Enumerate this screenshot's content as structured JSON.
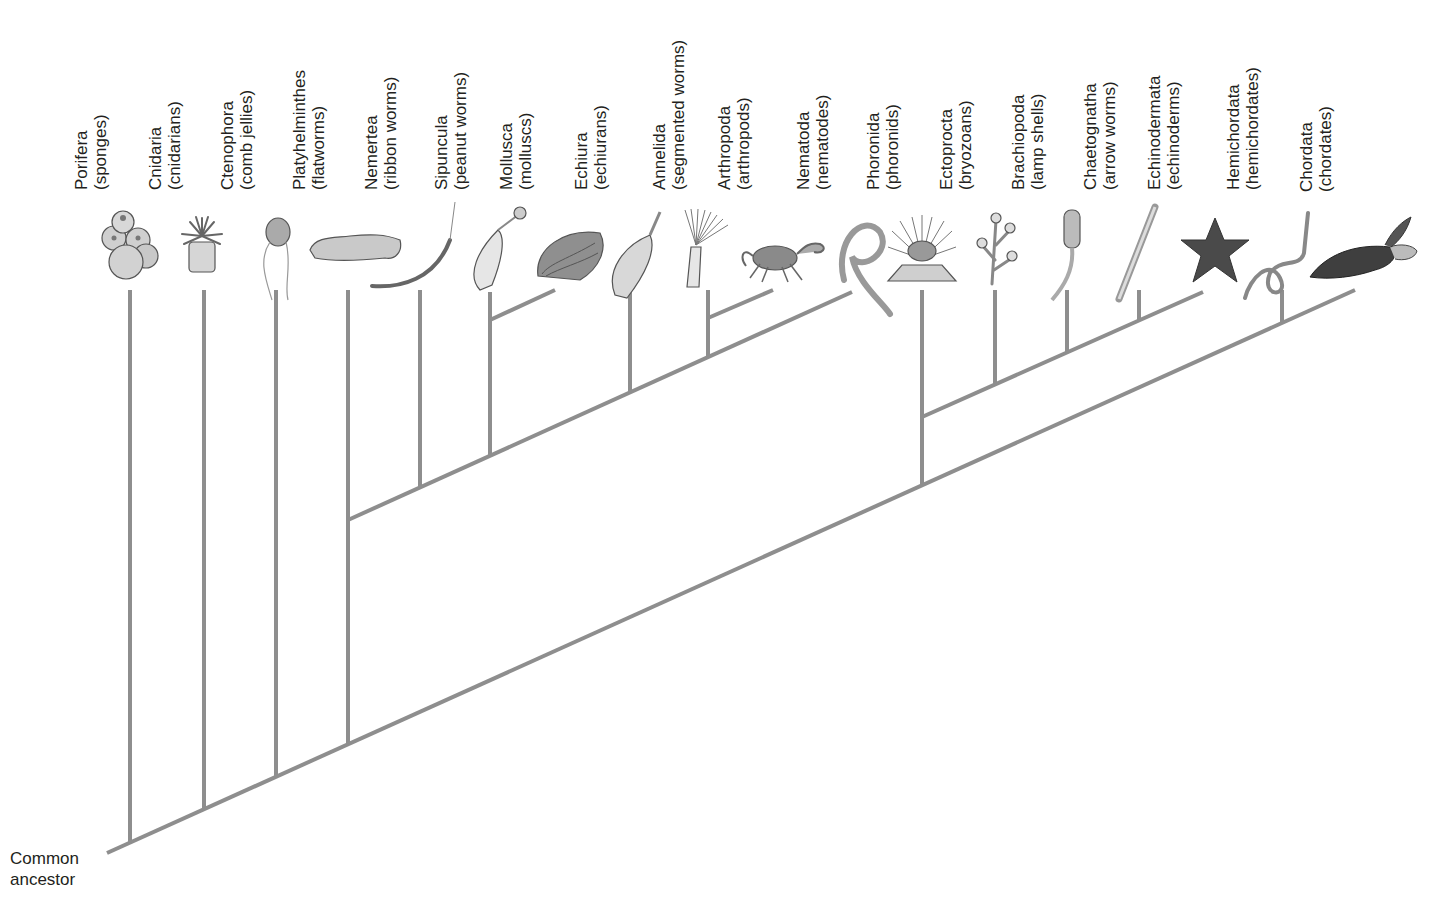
{
  "diagram": {
    "root_label": "Common ancestor",
    "line_color": "#8e8e8e",
    "taxa": [
      {
        "name": "Porifera",
        "common": "(sponges)",
        "icon": "sponge-icon",
        "x": 130
      },
      {
        "name": "Cnidaria",
        "common": "(cnidarians)",
        "icon": "sea-anemone-icon",
        "x": 204
      },
      {
        "name": "Ctenophora",
        "common": "(comb jellies)",
        "icon": "comb-jelly-icon",
        "x": 276
      },
      {
        "name": "Platyhelminthes",
        "common": "(flatworms)",
        "icon": "flatworm-icon",
        "x": 348
      },
      {
        "name": "Nemertea",
        "common": "(ribbon worms)",
        "icon": "ribbon-worm-icon",
        "x": 420
      },
      {
        "name": "Sipuncula",
        "common": "(peanut worms)",
        "icon": "peanut-worm-icon",
        "x": 490
      },
      {
        "name": "Mollusca",
        "common": "(molluscs)",
        "icon": "clam-icon",
        "x": 555
      },
      {
        "name": "Echiura",
        "common": "(echiurans)",
        "icon": "echiuran-icon",
        "x": 630
      },
      {
        "name": "Annelida",
        "common": "(segmented worms)",
        "icon": "tube-worm-icon",
        "x": 708
      },
      {
        "name": "Arthropoda",
        "common": "(arthropods)",
        "icon": "crab-icon",
        "x": 773
      },
      {
        "name": "Nematoda",
        "common": "(nematodes)",
        "icon": "roundworm-icon",
        "x": 852
      },
      {
        "name": "Phoronida",
        "common": "(phoronids)",
        "icon": "phoronid-icon",
        "x": 922
      },
      {
        "name": "Ectoprocta",
        "common": "(bryozoans)",
        "icon": "bryozoan-icon",
        "x": 995
      },
      {
        "name": "Brachiopoda",
        "common": "(lamp shells)",
        "icon": "lamp-shell-icon",
        "x": 1067
      },
      {
        "name": "Chaetognatha",
        "common": "(arrow worms)",
        "icon": "arrow-worm-icon",
        "x": 1139
      },
      {
        "name": "Echinodermata",
        "common": "(echinoderms)",
        "icon": "sea-star-icon",
        "x": 1203
      },
      {
        "name": "Hemichordata",
        "common": "(hemichordates)",
        "icon": "acorn-worm-icon",
        "x": 1282
      },
      {
        "name": "Chordata",
        "common": "(chordates)",
        "icon": "sea-turtle-icon",
        "x": 1355
      }
    ],
    "clades": [
      {
        "name": "main-trunk",
        "from": [
          107,
          853
        ],
        "to": [
          1355,
          290
        ]
      },
      {
        "name": "protostome-branch",
        "from": [
          348,
          520
        ],
        "to": [
          852,
          292
        ]
      },
      {
        "name": "sipuncula-mollusca-branch",
        "from": [
          490,
          320
        ],
        "to": [
          555,
          290
        ]
      },
      {
        "name": "annelida-arthropoda-branch",
        "from": [
          708,
          318
        ],
        "to": [
          773,
          290
        ]
      },
      {
        "name": "lophophorate-branch",
        "from": [
          922,
          417
        ],
        "to": [
          1203,
          292
        ]
      }
    ],
    "stems": [
      {
        "taxon": "Porifera",
        "x": 130,
        "y1": 843,
        "y2": 290
      },
      {
        "taxon": "Cnidaria",
        "x": 204,
        "y1": 809,
        "y2": 290
      },
      {
        "taxon": "Ctenophora",
        "x": 276,
        "y1": 777,
        "y2": 290
      },
      {
        "taxon": "Platyhelminthes",
        "x": 348,
        "y1": 744,
        "y2": 290
      },
      {
        "taxon": "Nemertea",
        "x": 420,
        "y1": 487,
        "y2": 290
      },
      {
        "taxon": "Sipuncula",
        "x": 490,
        "y1": 456,
        "y2": 292
      },
      {
        "taxon": "Echiura",
        "x": 630,
        "y1": 392,
        "y2": 292
      },
      {
        "taxon": "Annelida",
        "x": 708,
        "y1": 357,
        "y2": 290
      },
      {
        "taxon": "Phoronida",
        "x": 922,
        "y1": 485,
        "y2": 290
      },
      {
        "taxon": "Ectoprocta",
        "x": 995,
        "y1": 384,
        "y2": 290
      },
      {
        "taxon": "Brachiopoda",
        "x": 1067,
        "y1": 352,
        "y2": 290
      },
      {
        "taxon": "Chaetognatha",
        "x": 1139,
        "y1": 320,
        "y2": 290
      },
      {
        "taxon": "Hemichordata",
        "x": 1282,
        "y1": 323,
        "y2": 290
      }
    ]
  }
}
